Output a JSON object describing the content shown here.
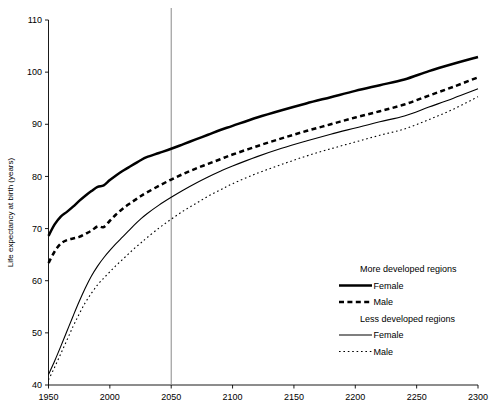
{
  "chart_data": {
    "type": "line",
    "title": "",
    "xlabel": "",
    "ylabel": "Life expectancy at birth (years)",
    "xlim": [
      1950,
      2300
    ],
    "ylim": [
      40,
      110
    ],
    "xticks": [
      1950,
      2000,
      2050,
      2100,
      2150,
      2200,
      2250,
      2300
    ],
    "yticks": [
      40,
      50,
      60,
      70,
      80,
      90,
      100,
      110
    ],
    "grid": false,
    "legend_position": "lower-right",
    "annotations": [
      {
        "name": "projection-start-line",
        "type": "vline",
        "x": 2050,
        "color": "#8a8a8a"
      }
    ],
    "legend_groups": [
      {
        "heading": "More developed regions",
        "entries": [
          {
            "label": "Female",
            "style": "solid",
            "width": "thick"
          },
          {
            "label": "Male",
            "style": "dashed",
            "width": "thick"
          }
        ]
      },
      {
        "heading": "Less developed regions",
        "entries": [
          {
            "label": "Female",
            "style": "solid",
            "width": "thin"
          },
          {
            "label": "Male",
            "style": "dotted",
            "width": "thin"
          }
        ]
      }
    ],
    "x": [
      1950,
      1955,
      1960,
      1965,
      1970,
      1975,
      1980,
      1985,
      1990,
      1995,
      2000,
      2005,
      2010,
      2015,
      2020,
      2025,
      2030,
      2040,
      2050,
      2060,
      2070,
      2080,
      2090,
      2100,
      2120,
      2140,
      2160,
      2180,
      2200,
      2220,
      2240,
      2260,
      2280,
      2300
    ],
    "series": [
      {
        "name": "More developed regions Female",
        "group": "More developed regions",
        "sex": "Female",
        "style": "solid",
        "width": "thick",
        "values": [
          68.6,
          70.8,
          72.3,
          73.2,
          74.2,
          75.3,
          76.3,
          77.2,
          78.0,
          78.3,
          79.3,
          80.2,
          81.0,
          81.7,
          82.4,
          83.1,
          83.7,
          84.5,
          85.3,
          86.2,
          87.1,
          88.0,
          88.9,
          89.7,
          91.3,
          92.7,
          94.0,
          95.2,
          96.4,
          97.5,
          98.6,
          100.2,
          101.6,
          102.9
        ]
      },
      {
        "name": "More developed regions Male",
        "group": "More developed regions",
        "sex": "Male",
        "style": "dashed",
        "width": "thick",
        "values": [
          63.4,
          65.6,
          67.1,
          67.8,
          68.1,
          68.4,
          69.0,
          69.6,
          70.4,
          70.3,
          71.5,
          72.7,
          73.7,
          74.6,
          75.4,
          76.2,
          76.9,
          78.2,
          79.4,
          80.5,
          81.5,
          82.4,
          83.3,
          84.2,
          85.8,
          87.3,
          88.7,
          90.0,
          91.3,
          92.5,
          93.8,
          95.5,
          97.2,
          99.0
        ]
      },
      {
        "name": "Less developed regions Female",
        "group": "Less developed regions",
        "sex": "Female",
        "style": "solid",
        "width": "thin",
        "values": [
          42.0,
          44.6,
          47.4,
          50.3,
          53.2,
          56.0,
          58.6,
          60.9,
          62.8,
          64.4,
          65.8,
          67.1,
          68.3,
          69.5,
          70.7,
          71.8,
          72.8,
          74.5,
          76.0,
          77.4,
          78.7,
          79.9,
          81.0,
          82.0,
          83.8,
          85.4,
          86.8,
          88.1,
          89.3,
          90.5,
          91.6,
          93.3,
          95.0,
          96.8
        ]
      },
      {
        "name": "Less developed regions Male",
        "group": "Less developed regions",
        "sex": "Male",
        "style": "dotted",
        "width": "thin",
        "values": [
          41.0,
          43.4,
          46.0,
          48.6,
          51.2,
          53.6,
          55.8,
          57.6,
          59.2,
          60.5,
          61.7,
          62.9,
          64.0,
          65.1,
          66.2,
          67.2,
          68.2,
          70.1,
          71.8,
          73.4,
          74.8,
          76.2,
          77.4,
          78.6,
          80.6,
          82.3,
          83.9,
          85.3,
          86.6,
          87.9,
          89.1,
          90.9,
          92.9,
          95.3
        ]
      }
    ]
  }
}
